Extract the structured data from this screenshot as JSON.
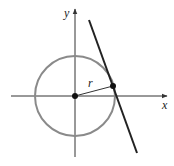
{
  "diagram": {
    "type": "tangent-line-to-circle",
    "labels": {
      "x_axis": "x",
      "y_axis": "y",
      "radius": "r"
    },
    "colors": {
      "axes": "#333333",
      "circle": "#8a8a8a",
      "tangent_line": "#222222",
      "radius": "#333333",
      "points": "#111111"
    },
    "elements": {
      "circle": {
        "center": "origin",
        "style": "gray outline"
      },
      "radius_segment": {
        "from": "center",
        "to": "point of tangency"
      },
      "tangent_line": {
        "touches_circle_at": "point of tangency"
      },
      "points": [
        "center",
        "point of tangency"
      ]
    }
  }
}
